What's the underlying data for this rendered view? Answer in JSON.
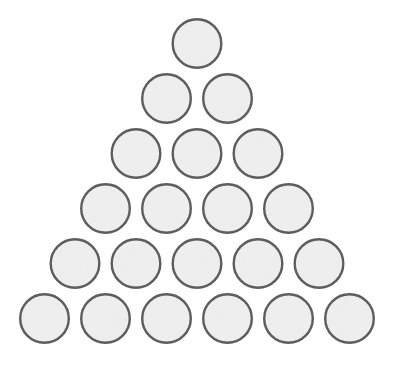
{
  "figure": {
    "kind": "dot-arrangement-diagram",
    "shape_name": "triangle",
    "background_color": "#ffffff",
    "canvas": {
      "width": 395,
      "height": 365
    },
    "circle_style": {
      "fill_color": "#f0f0f0",
      "stroke_color": "#555555",
      "stroke_width": 2.4,
      "radius": 25.5,
      "diameter": 51
    },
    "layout": {
      "row_count": 6,
      "total_circles": 21,
      "horizontal_pitch": 61,
      "vertical_pitch": 55,
      "first_row_center": {
        "x": 197,
        "y": 43.5
      }
    },
    "rows": [
      {
        "index": 1,
        "count": 1,
        "label": "row-1",
        "circles": [
          {
            "id": "c-1-1",
            "cx": 197,
            "cy": 43.5
          }
        ]
      },
      {
        "index": 2,
        "count": 2,
        "label": "row-2",
        "circles": [
          {
            "id": "c-2-1",
            "cx": 166.5,
            "cy": 98.5
          },
          {
            "id": "c-2-2",
            "cx": 227.5,
            "cy": 98.5
          }
        ]
      },
      {
        "index": 3,
        "count": 3,
        "label": "row-3",
        "circles": [
          {
            "id": "c-3-1",
            "cx": 136,
            "cy": 153.5
          },
          {
            "id": "c-3-2",
            "cx": 197,
            "cy": 153.5
          },
          {
            "id": "c-3-3",
            "cx": 258,
            "cy": 153.5
          }
        ]
      },
      {
        "index": 4,
        "count": 4,
        "label": "row-4",
        "circles": [
          {
            "id": "c-4-1",
            "cx": 105.5,
            "cy": 208.5
          },
          {
            "id": "c-4-2",
            "cx": 166.5,
            "cy": 208.5
          },
          {
            "id": "c-4-3",
            "cx": 227.5,
            "cy": 208.5
          },
          {
            "id": "c-4-4",
            "cx": 288.5,
            "cy": 208.5
          }
        ]
      },
      {
        "index": 5,
        "count": 5,
        "label": "row-5",
        "circles": [
          {
            "id": "c-5-1",
            "cx": 75,
            "cy": 263.5
          },
          {
            "id": "c-5-2",
            "cx": 136,
            "cy": 263.5
          },
          {
            "id": "c-5-3",
            "cx": 197,
            "cy": 263.5
          },
          {
            "id": "c-5-4",
            "cx": 258,
            "cy": 263.5
          },
          {
            "id": "c-5-5",
            "cx": 319,
            "cy": 263.5
          }
        ]
      },
      {
        "index": 6,
        "count": 6,
        "label": "row-6",
        "circles": [
          {
            "id": "c-6-1",
            "cx": 44.5,
            "cy": 318.5
          },
          {
            "id": "c-6-2",
            "cx": 105.5,
            "cy": 318.5
          },
          {
            "id": "c-6-3",
            "cx": 166.5,
            "cy": 318.5
          },
          {
            "id": "c-6-4",
            "cx": 227.5,
            "cy": 318.5
          },
          {
            "id": "c-6-5",
            "cx": 288.5,
            "cy": 318.5
          },
          {
            "id": "c-6-6",
            "cx": 349.5,
            "cy": 318.5
          }
        ]
      }
    ]
  }
}
